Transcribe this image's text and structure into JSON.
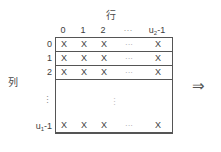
{
  "diagram": {
    "row_axis_caption": "行",
    "column_axis_caption": "列",
    "arrow_symbol": "⇒",
    "cell_mark": "X",
    "horizontal_ellipsis": "···",
    "vertical_ellipsis": "⋮",
    "column_headers": [
      {
        "label": "0",
        "x": 63
      },
      {
        "label": "1",
        "x": 83
      },
      {
        "label": "2",
        "x": 103
      },
      {
        "label": "···",
        "x": 128
      },
      {
        "label": "u",
        "sub": "2",
        "suffix": "-1",
        "x": 157
      }
    ],
    "row_headers": [
      {
        "label": "0",
        "y": 0
      },
      {
        "label": "1",
        "y": 14
      },
      {
        "label": "2",
        "y": 28
      },
      {
        "label": "⋮",
        "y": 56
      },
      {
        "label": "u",
        "sub": "1",
        "suffix": "-1",
        "y": 82
      }
    ],
    "grid_rows": [
      {
        "type": "data",
        "y": 0
      },
      {
        "type": "data",
        "y": 14
      },
      {
        "type": "data",
        "y": 28
      },
      {
        "type": "blank",
        "y": 42,
        "height": 53
      },
      {
        "type": "data",
        "y": 81,
        "last": true
      }
    ],
    "cell_columns": [
      {
        "mark": "X",
        "x": 8
      },
      {
        "mark": "X",
        "x": 28
      },
      {
        "mark": "X",
        "x": 48
      },
      {
        "mark": "···",
        "x": 73,
        "dots": true
      },
      {
        "mark": "X",
        "x": 102
      }
    ]
  },
  "colors": {
    "background": "#ffffff",
    "border": "#555555",
    "text": "#3d3d3d",
    "muted": "#9a9a9a"
  }
}
